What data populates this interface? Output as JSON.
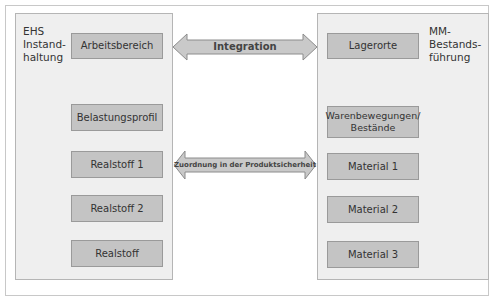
{
  "diagram": {
    "left_panel": {
      "title": "EHS\nInstand-\nhaltung",
      "boxes": [
        "Arbeitsbereich",
        "Belastungsprofil",
        "Realstoff 1",
        "Realstoff 2",
        "Realstoff"
      ]
    },
    "right_panel": {
      "title": "MM-\nBestands-\nführung",
      "boxes": [
        "Lagerorte",
        "Warenbewegungen/\nBestände",
        "Material 1",
        "Material 2",
        "Material 3"
      ]
    },
    "arrows": [
      {
        "label": "Integration",
        "direction": "bidirectional"
      },
      {
        "label": "Zuordnung in der Produktsicherheit",
        "direction": "bidirectional"
      }
    ],
    "colors": {
      "panel_fill": "#efefef",
      "box_fill": "#c4c4c4",
      "arrow_fill": "#c9c9c9",
      "border": "#9a9a9a"
    }
  }
}
